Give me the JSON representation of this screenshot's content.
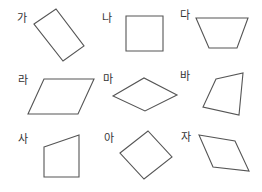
{
  "figure": {
    "background": "#ffffff",
    "stroke_color": "#555555",
    "label_color": "#333333",
    "shapes": [
      {
        "label": "가",
        "label_pos": [
          17,
          22
        ],
        "points": "34,24 56,9 84,46 63,61"
      },
      {
        "label": "나",
        "label_pos": [
          102,
          22
        ],
        "points": "126,16 163,16 163,51 126,51"
      },
      {
        "label": "다",
        "label_pos": [
          180,
          19
        ],
        "points": "196,18 248,18 237,48 209,48"
      },
      {
        "label": "라",
        "label_pos": [
          18,
          84
        ],
        "points": "44,79 94,79 78,114 28,114"
      },
      {
        "label": "마",
        "label_pos": [
          103,
          83
        ],
        "points": "113,96 144,78 177,95 145,111"
      },
      {
        "label": "바",
        "label_pos": [
          180,
          80
        ],
        "points": "216,79 243,73 239,115 203,107"
      },
      {
        "label": "사",
        "label_pos": [
          18,
          143
        ],
        "points": "44,147 79,135 79,177 44,177"
      },
      {
        "label": "아",
        "label_pos": [
          104,
          142
        ],
        "points": "120,153 148,131 172,157 144,179"
      },
      {
        "label": "자",
        "label_pos": [
          181,
          141
        ],
        "points": "199,135 235,141 249,171 213,167"
      }
    ]
  }
}
